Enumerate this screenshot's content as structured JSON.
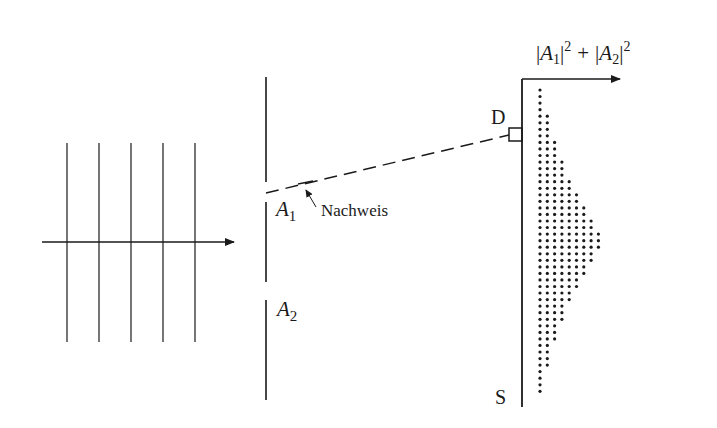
{
  "diagram": {
    "labels": {
      "detector": "D",
      "screen": "S",
      "slit1_main": "A",
      "slit1_sub": "1",
      "slit2_main": "A",
      "slit2_sub": "2",
      "detection": "Nachweis",
      "intensity_formula": "|A1|^2 + |A2|^2",
      "formula_parts": {
        "bar_open": "|",
        "a": "A",
        "sub1": "1",
        "sub2": "2",
        "bar_close": "|",
        "sup": "2",
        "plus": "+"
      }
    },
    "incoming_wave": {
      "wavefront_x": [
        67,
        99,
        131,
        163,
        195
      ],
      "wavefront_y_range": [
        143,
        342
      ],
      "propagation_arrow": {
        "x1": 42,
        "x2": 234,
        "y": 242
      }
    },
    "barrier": {
      "x": 266,
      "segments": [
        [
          77,
          182
        ],
        [
          202,
          282
        ],
        [
          300,
          400
        ]
      ],
      "slits": [
        {
          "name": "A1",
          "y_range": [
            182,
            202
          ]
        },
        {
          "name": "A2",
          "y_range": [
            282,
            300
          ]
        }
      ]
    },
    "detector_path": {
      "from": [
        266,
        193
      ],
      "to": [
        509,
        135
      ],
      "style": "dashed"
    },
    "detector_box": {
      "x": 509,
      "y": 128,
      "w": 13,
      "h": 13
    },
    "screen": {
      "x": 522,
      "y_range": [
        79,
        407
      ]
    },
    "intensity_axis": {
      "x1": 522,
      "x2": 620,
      "y": 79
    },
    "intensity_pattern": {
      "type": "dot-histogram",
      "row_start_y": 90,
      "row_step": 6.55,
      "col_start_x": 540,
      "col_step": 7.3,
      "dot_counts": [
        1,
        1,
        1,
        1,
        2,
        2,
        2,
        2,
        3,
        3,
        3,
        4,
        4,
        4,
        5,
        5,
        6,
        6,
        7,
        7,
        8,
        8,
        9,
        9,
        9,
        8,
        8,
        7,
        7,
        6,
        6,
        5,
        5,
        4,
        4,
        4,
        3,
        3,
        3,
        2,
        2,
        2,
        2,
        1,
        1,
        1,
        1
      ]
    },
    "colors": {
      "ink": "#1a1a1a",
      "background": "#ffffff"
    }
  }
}
